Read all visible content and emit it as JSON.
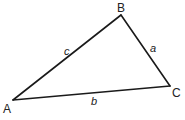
{
  "diagram": {
    "type": "triangle",
    "stroke_color": "#1a1a1a",
    "background": "#ffffff",
    "vertices": [
      {
        "id": "A",
        "label": "A",
        "x": 13,
        "y": 100,
        "label_x": 3,
        "label_y": 113
      },
      {
        "id": "B",
        "label": "B",
        "x": 121,
        "y": 15,
        "label_x": 117,
        "label_y": 12
      },
      {
        "id": "C",
        "label": "C",
        "x": 170,
        "y": 86,
        "label_x": 172,
        "label_y": 97
      }
    ],
    "sides": [
      {
        "id": "c",
        "label": "c",
        "from": "A",
        "to": "B",
        "label_x": 64,
        "label_y": 55
      },
      {
        "id": "a",
        "label": "a",
        "from": "B",
        "to": "C",
        "label_x": 150,
        "label_y": 52
      },
      {
        "id": "b",
        "label": "b",
        "from": "A",
        "to": "C",
        "label_x": 91,
        "label_y": 105
      }
    ]
  }
}
